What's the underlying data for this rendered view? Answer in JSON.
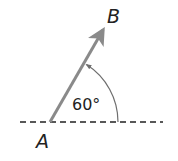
{
  "diagram": {
    "point_a": {
      "label": "A",
      "x": 50,
      "y": 122
    },
    "point_b": {
      "label": "B"
    },
    "angle": {
      "value": 60,
      "label": "60°"
    },
    "colors": {
      "vector": "#8a8a8a",
      "baseline": "#222222",
      "arc": "#6e6e6e",
      "text": "#222222"
    }
  }
}
